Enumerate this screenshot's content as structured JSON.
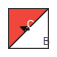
{
  "icon": {
    "name": "diagonal-split-cell",
    "top_label": "C",
    "bottom_label": "B",
    "colors": {
      "top_fill": "#f0463c",
      "bottom_fill": "#ffffff",
      "border": "#333333",
      "diagonal": "#222222"
    },
    "cursor": "arrow-cursor-icon"
  }
}
